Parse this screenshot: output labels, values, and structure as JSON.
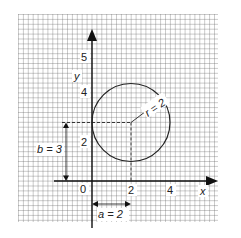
{
  "diagram": {
    "axes": {
      "x_label": "x",
      "y_label": "y",
      "origin_label": "0",
      "x_ticks": [
        {
          "value": 2,
          "label": "2"
        },
        {
          "value": 4,
          "label": "4"
        }
      ],
      "y_ticks": [
        {
          "value": 2,
          "label": "2"
        },
        {
          "value": 4,
          "label": "4"
        },
        {
          "value": 5,
          "label": "5"
        }
      ]
    },
    "circle": {
      "center": [
        2,
        3
      ],
      "radius": 2,
      "radius_label": "r = 2"
    },
    "annotations": {
      "a_label": "a = 2",
      "b_label": "b = 3"
    }
  }
}
